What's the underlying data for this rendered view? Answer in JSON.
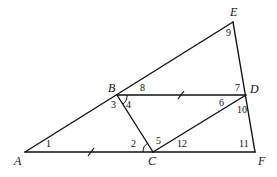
{
  "diagram": {
    "points": [
      {
        "id": "A",
        "label": "A",
        "x": 25,
        "y": 152,
        "lx": 14,
        "ly": 165
      },
      {
        "id": "B",
        "label": "B",
        "x": 117,
        "y": 95,
        "lx": 108,
        "ly": 92
      },
      {
        "id": "C",
        "label": "C",
        "x": 153,
        "y": 152,
        "lx": 148,
        "ly": 165
      },
      {
        "id": "D",
        "label": "D",
        "x": 246,
        "y": 95,
        "lx": 250,
        "ly": 93
      },
      {
        "id": "E",
        "label": "E",
        "x": 233,
        "y": 22,
        "lx": 230,
        "ly": 16
      },
      {
        "id": "F",
        "label": "F",
        "x": 255,
        "y": 152,
        "lx": 258,
        "ly": 165
      }
    ],
    "segments": [
      {
        "from": "A",
        "to": "E"
      },
      {
        "from": "A",
        "to": "F"
      },
      {
        "from": "B",
        "to": "D"
      },
      {
        "from": "B",
        "to": "C"
      },
      {
        "from": "C",
        "to": "D"
      },
      {
        "from": "E",
        "to": "F"
      }
    ],
    "congruence_ticks": [
      {
        "segment": "AC",
        "x": 91,
        "y": 152
      },
      {
        "segment": "BD",
        "x": 181,
        "y": 95
      }
    ],
    "angles": [
      {
        "label": "1",
        "x": 46,
        "y": 147
      },
      {
        "label": "2",
        "x": 131,
        "y": 147
      },
      {
        "label": "3",
        "x": 111,
        "y": 108
      },
      {
        "label": "4",
        "x": 126,
        "y": 108
      },
      {
        "label": "5",
        "x": 156,
        "y": 144
      },
      {
        "label": "6",
        "x": 219,
        "y": 106
      },
      {
        "label": "7",
        "x": 235,
        "y": 91
      },
      {
        "label": "8",
        "x": 140,
        "y": 91
      },
      {
        "label": "9",
        "x": 226,
        "y": 36
      },
      {
        "label": "10",
        "x": 237,
        "y": 113
      },
      {
        "label": "11",
        "x": 239,
        "y": 147
      },
      {
        "label": "12",
        "x": 177,
        "y": 147
      }
    ],
    "marked_angles": [
      {
        "at": "B",
        "angle": "4"
      },
      {
        "at": "C",
        "angle": "2"
      }
    ]
  }
}
